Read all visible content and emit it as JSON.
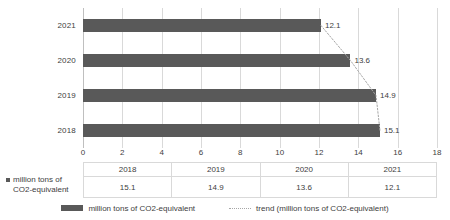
{
  "chart_data": {
    "type": "bar",
    "orientation": "horizontal",
    "title": "",
    "xlabel": "",
    "ylabel": "",
    "categories": [
      "2021",
      "2020",
      "2019",
      "2018"
    ],
    "values": [
      12.1,
      13.6,
      14.9,
      15.1
    ],
    "data_labels": [
      "12.1",
      "13.6",
      "14.9",
      "15.1"
    ],
    "xlim": [
      0,
      18
    ],
    "xticks": [
      "0",
      "2",
      "4",
      "6",
      "8",
      "10",
      "12",
      "14",
      "16",
      "18"
    ],
    "xtick_values": [
      0,
      2,
      4,
      6,
      8,
      10,
      12,
      14,
      16,
      18
    ],
    "grid": true,
    "grid_axis": "x",
    "bar_color": "#595959",
    "grid_color": "#d9d9d9",
    "trend_color": "#a6a6a6",
    "series": [
      {
        "name": "million tons of CO2-equivalent",
        "type": "bar",
        "categories": [
          "2021",
          "2020",
          "2019",
          "2018"
        ],
        "values": [
          12.1,
          13.6,
          14.9,
          15.1
        ]
      },
      {
        "name": "trend (million tons of CO2-equivalent)",
        "type": "line",
        "style": "dotted",
        "categories": [
          "2021",
          "2020",
          "2019",
          "2018"
        ],
        "values": [
          12.1,
          13.6,
          14.9,
          15.1
        ]
      }
    ],
    "legend": {
      "position": "bottom",
      "entries": [
        {
          "label": "million tons of CO2-equivalent",
          "marker": "bar-swatch",
          "color": "#595959"
        },
        {
          "label": "trend (million tons of CO2-equivalent)",
          "marker": "dotted-line",
          "color": "#a6a6a6"
        }
      ]
    },
    "data_table": {
      "row_header": "million tons of CO2-equivalent",
      "row_header_line1": "million tons of",
      "row_header_line2": "CO2-equivalent",
      "columns": [
        "2018",
        "2019",
        "2020",
        "2021"
      ],
      "rows": [
        {
          "label": "million tons of CO2-equivalent",
          "cells": [
            "15.1",
            "14.9",
            "13.6",
            "12.1"
          ]
        }
      ]
    }
  }
}
